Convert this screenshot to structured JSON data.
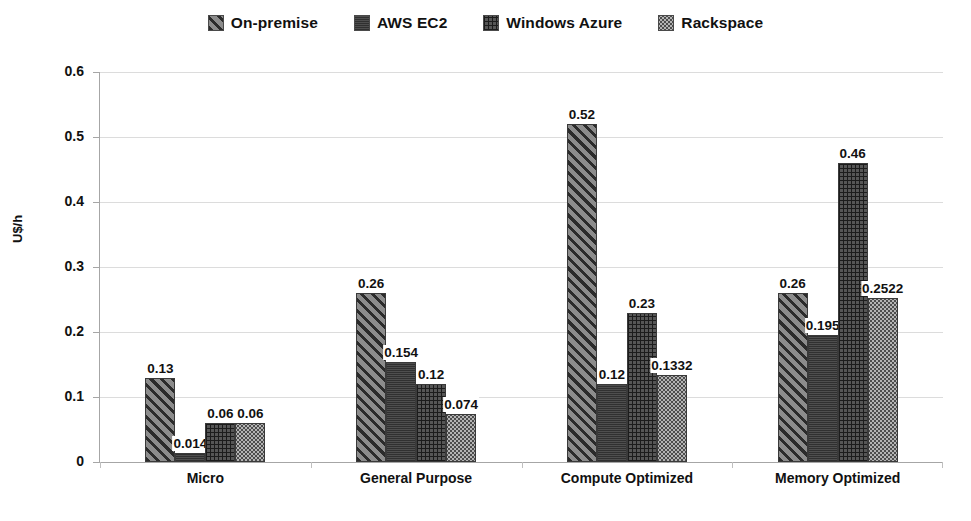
{
  "chart_data": {
    "type": "bar",
    "title": "",
    "xlabel": "",
    "ylabel": "U$/h",
    "ylim": [
      0,
      0.6
    ],
    "ytick_labels": [
      "0.6",
      "0.5",
      "0.4",
      "0.3",
      "0.2",
      "0.1",
      "0"
    ],
    "ytick_values": [
      0.6,
      0.5,
      0.4,
      0.3,
      0.2,
      0.1,
      0
    ],
    "grid": true,
    "legend_position": "top-center",
    "categories": [
      "Micro",
      "General Purpose",
      "Compute Optimized",
      "Memory Optimized"
    ],
    "series": [
      {
        "name": "On-premise",
        "pattern": "diagonal-stripes",
        "color": "#6e6e6e",
        "values": [
          0.13,
          0.26,
          0.52,
          0.26
        ],
        "labels": [
          "0.13",
          "0.26",
          "0.52",
          "0.26"
        ]
      },
      {
        "name": "AWS EC2",
        "pattern": "solid-dark",
        "color": "#3d3d3d",
        "values": [
          0.014,
          0.154,
          0.12,
          0.195
        ],
        "labels": [
          "0.014",
          "0.154",
          "0.12",
          "0.195"
        ]
      },
      {
        "name": "Windows Azure",
        "pattern": "crosshatch-grid",
        "color": "#565656",
        "values": [
          0.06,
          0.12,
          0.23,
          0.46
        ],
        "labels": [
          "0.06",
          "0.12",
          "0.23",
          "0.46"
        ]
      },
      {
        "name": "Rackspace",
        "pattern": "dotted-light",
        "color": "#b4b4b4",
        "values": [
          0.06,
          0.074,
          0.1332,
          0.2522
        ],
        "labels": [
          "0.06",
          "0.074",
          "0.1332",
          "0.2522"
        ]
      }
    ]
  },
  "legend": {
    "items": [
      {
        "label": "On-premise"
      },
      {
        "label": "AWS EC2"
      },
      {
        "label": "Windows Azure"
      },
      {
        "label": "Rackspace"
      }
    ]
  },
  "axis": {
    "y_title": "U$/h"
  }
}
